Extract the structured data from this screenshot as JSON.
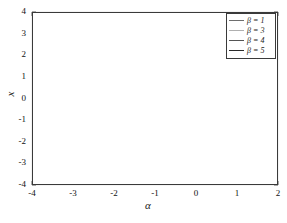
{
  "chart_data": {
    "type": "line",
    "title": "",
    "xlabel": "α",
    "ylabel": "x",
    "xlim": [
      -4,
      2
    ],
    "ylim": [
      -4,
      4
    ],
    "grid": true,
    "legend_position": "top-right",
    "xticks": [
      "-4",
      "-3",
      "-2",
      "-1",
      "0",
      "1",
      "2"
    ],
    "yticks": [
      "4",
      "3",
      "2",
      "1",
      "0",
      "-1",
      "-2",
      "-3",
      "-4"
    ],
    "series": [
      {
        "name": "β = 1",
        "color": "#6e6e6e",
        "role": "outermost-fold",
        "fold_point": [
          -1.75,
          2.0
        ],
        "upper_branch": {
          "x": [
            -4.0,
            -3.6,
            -3.2,
            -2.8,
            -2.4,
            -2.1,
            -1.9,
            -1.78,
            -1.75,
            -1.8,
            -1.95,
            -2.3,
            -2.8,
            -3.3,
            -3.7,
            -4.0
          ],
          "y": [
            4.0,
            3.82,
            3.6,
            3.36,
            3.05,
            2.75,
            2.5,
            2.2,
            2.0,
            1.85,
            1.68,
            1.48,
            1.3,
            1.15,
            1.06,
            1.0
          ]
        },
        "lower_branch": {
          "x": [
            -4.0,
            -3.6,
            -3.2,
            -2.8,
            -2.4,
            -2.1,
            -1.9,
            -1.78,
            -1.75,
            -1.8,
            -1.95,
            -2.3,
            -2.8,
            -3.3,
            -3.7,
            -4.0
          ],
          "y": [
            -4.0,
            -3.82,
            -3.6,
            -3.36,
            -3.05,
            -2.75,
            -2.5,
            -2.2,
            -2.0,
            -1.85,
            -1.68,
            -1.48,
            -1.3,
            -1.15,
            -1.06,
            -1.0
          ]
        }
      },
      {
        "name": "β = 3",
        "color": "#b0b0b0",
        "role": "mid-fold-light",
        "fold_point": [
          -2.25,
          2.05
        ],
        "upper_branch": {
          "x": [
            -4.0,
            -3.7,
            -3.4,
            -3.05,
            -2.75,
            -2.5,
            -2.33,
            -2.26,
            -2.3,
            -2.45,
            -2.7,
            -3.05,
            -3.45,
            -3.75,
            -4.0
          ],
          "y": [
            3.88,
            3.72,
            3.52,
            3.28,
            3.0,
            2.72,
            2.45,
            2.2,
            2.02,
            1.9,
            1.8,
            1.7,
            1.62,
            1.58,
            1.55
          ]
        },
        "lower_branch": {
          "x": [
            -4.0,
            -3.7,
            -3.4,
            -3.05,
            -2.75,
            -2.5,
            -2.33,
            -2.26,
            -2.3,
            -2.45,
            -2.7,
            -3.05,
            -3.45,
            -3.75,
            -4.0
          ],
          "y": [
            -3.88,
            -3.72,
            -3.52,
            -3.28,
            -3.0,
            -2.72,
            -2.45,
            -2.2,
            -2.02,
            -1.9,
            -1.8,
            -1.7,
            -1.62,
            -1.58,
            -1.55
          ]
        }
      },
      {
        "name": "β = 4",
        "color": "#555555",
        "role": "inner-fold",
        "fold_point": [
          -2.72,
          2.35
        ],
        "upper_branch": {
          "x": [
            -4.0,
            -3.75,
            -3.5,
            -3.22,
            -3.0,
            -2.85,
            -2.76,
            -2.72,
            -2.78,
            -2.95,
            -3.2,
            -3.5,
            -3.78,
            -4.0
          ],
          "y": [
            3.78,
            3.62,
            3.42,
            3.15,
            2.9,
            2.68,
            2.5,
            2.32,
            2.18,
            2.05,
            1.95,
            1.88,
            1.82,
            1.8
          ]
        },
        "lower_branch": {
          "x": [
            -4.0,
            -3.75,
            -3.5,
            -3.22,
            -3.0,
            -2.85,
            -2.76,
            -2.72,
            -2.78,
            -2.95,
            -3.2,
            -3.5,
            -3.78,
            -4.0
          ],
          "y": [
            -3.78,
            -3.62,
            -3.42,
            -3.15,
            -2.9,
            -2.68,
            -2.5,
            -2.32,
            -2.18,
            -2.05,
            -1.95,
            -1.88,
            -1.82,
            -1.8
          ]
        }
      },
      {
        "name": "β = 5",
        "color": "#2b2b2b",
        "role": "innermost-fold",
        "fold_point": [
          -3.0,
          2.55
        ],
        "upper_branch": {
          "x": [
            -4.0,
            -3.8,
            -3.6,
            -3.4,
            -3.22,
            -3.08,
            -3.0,
            -3.02,
            -3.15,
            -3.35,
            -3.6,
            -3.85,
            -4.0
          ],
          "y": [
            3.7,
            3.55,
            3.38,
            3.15,
            2.92,
            2.72,
            2.5,
            2.35,
            2.22,
            2.12,
            2.05,
            2.0,
            1.98
          ]
        },
        "lower_branch": {
          "x": [
            -4.0,
            -3.8,
            -3.6,
            -3.4,
            -3.22,
            -3.08,
            -3.0,
            -3.02,
            -3.15,
            -3.35,
            -3.6,
            -3.85,
            -4.0
          ],
          "y": [
            -3.7,
            -3.55,
            -3.38,
            -3.15,
            -2.92,
            -2.72,
            -2.5,
            -2.35,
            -2.22,
            -2.12,
            -2.05,
            -2.0,
            -1.98
          ]
        }
      },
      {
        "name": "near-zero-band",
        "color": "#1a1a1a",
        "role": "overlapping-flat-branches",
        "x": [
          -4.0,
          2.0
        ],
        "y": [
          -0.2,
          -0.2
        ],
        "note": "thick dark horizontal band spanning full width just below x = 0"
      },
      {
        "name": "rising-branch",
        "color": "#6e6e6e",
        "role": "monotonic-s-curve",
        "x": [
          -4.0,
          -3.5,
          -3.0,
          -2.5,
          -2.0,
          -1.6,
          -1.3,
          -1.0,
          -0.7,
          -0.4,
          0.0,
          0.4,
          0.9,
          1.4,
          2.0
        ],
        "y": [
          -4.0,
          -3.62,
          -3.3,
          -3.0,
          -2.68,
          -2.4,
          -2.15,
          -1.85,
          -1.5,
          -1.2,
          -0.95,
          -0.82,
          -0.72,
          -0.66,
          -0.6
        ]
      }
    ]
  },
  "legend": {
    "items": [
      {
        "label": "β = 1",
        "color": "#6e6e6e"
      },
      {
        "label": "β = 3",
        "color": "#b0b0b0"
      },
      {
        "label": "β = 4",
        "color": "#555555"
      },
      {
        "label": "β = 5",
        "color": "#2b2b2b"
      }
    ]
  },
  "axes": {
    "x_label": "α",
    "y_label": "x",
    "x_ticks": [
      {
        "value": -4,
        "label": "-4"
      },
      {
        "value": -3,
        "label": "-3"
      },
      {
        "value": -2,
        "label": "-2"
      },
      {
        "value": -1,
        "label": "-1"
      },
      {
        "value": 0,
        "label": "0"
      },
      {
        "value": 1,
        "label": "1"
      },
      {
        "value": 2,
        "label": "2"
      }
    ],
    "y_ticks": [
      {
        "value": 4,
        "label": "4"
      },
      {
        "value": 3,
        "label": "3"
      },
      {
        "value": 2,
        "label": "2"
      },
      {
        "value": 1,
        "label": "1"
      },
      {
        "value": 0,
        "label": "0"
      },
      {
        "value": -1,
        "label": "-1"
      },
      {
        "value": -2,
        "label": "-2"
      },
      {
        "value": -3,
        "label": "-3"
      },
      {
        "value": -4,
        "label": "-4"
      }
    ]
  },
  "colors": {
    "axis": "#3a3a3a",
    "grid": "#d8d8d8",
    "background": "#ffffff"
  }
}
